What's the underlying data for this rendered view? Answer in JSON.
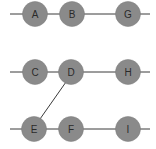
{
  "diagram": {
    "node_color": "#8a8a8a",
    "edge_color": "#3a3a3a",
    "nodes": [
      {
        "id": "A",
        "label": "A",
        "x": 35,
        "y": 14
      },
      {
        "id": "B",
        "label": "B",
        "x": 72,
        "y": 14
      },
      {
        "id": "G",
        "label": "G",
        "x": 128,
        "y": 14
      },
      {
        "id": "C",
        "label": "C",
        "x": 35,
        "y": 72
      },
      {
        "id": "D",
        "label": "D",
        "x": 71,
        "y": 72
      },
      {
        "id": "H",
        "label": "H",
        "x": 128,
        "y": 72
      },
      {
        "id": "E",
        "label": "E",
        "x": 34,
        "y": 129
      },
      {
        "id": "F",
        "label": "F",
        "x": 71,
        "y": 129
      },
      {
        "id": "I",
        "label": "I",
        "x": 128,
        "y": 129
      }
    ],
    "edges": [
      {
        "from": "start-row1",
        "to": "A"
      },
      {
        "from": "A",
        "to": "B"
      },
      {
        "from": "B",
        "to": "G"
      },
      {
        "from": "G",
        "to": "end-row1"
      },
      {
        "from": "start-row2",
        "to": "C"
      },
      {
        "from": "C",
        "to": "D"
      },
      {
        "from": "D",
        "to": "H"
      },
      {
        "from": "H",
        "to": "end-row2"
      },
      {
        "from": "D",
        "to": "E"
      },
      {
        "from": "start-row3",
        "to": "E"
      },
      {
        "from": "E",
        "to": "F"
      },
      {
        "from": "F",
        "to": "I"
      },
      {
        "from": "I",
        "to": "end-row3"
      }
    ]
  }
}
